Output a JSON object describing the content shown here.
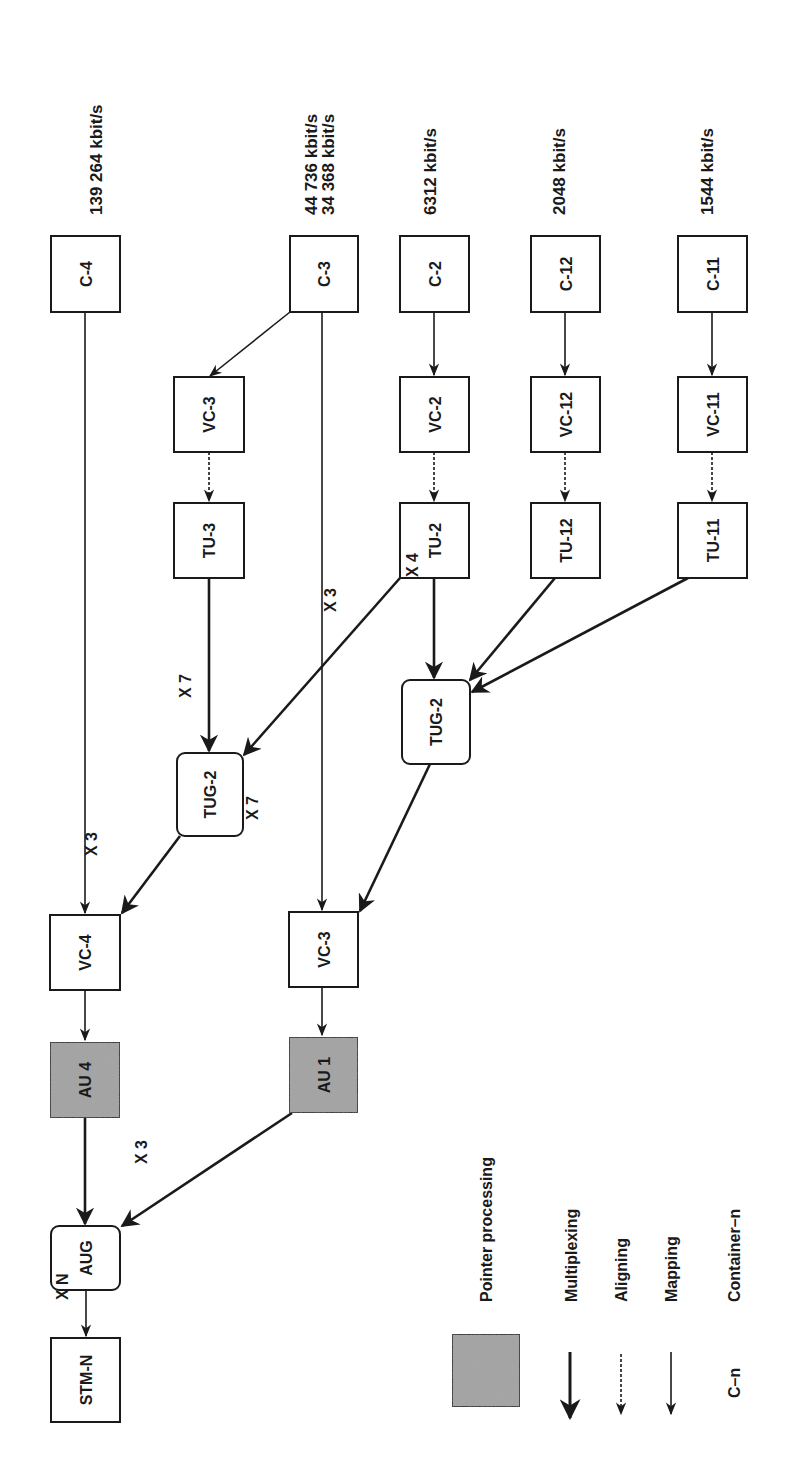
{
  "diagram": {
    "orientation": "rotated 90° counter-clockwise (text reads bottom-to-top)",
    "colors": {
      "stroke": "#1a1a1a",
      "box_fill": "#ffffff",
      "pointer_fill": "#a6a6a6",
      "background": "#ffffff"
    },
    "rates": [
      {
        "id": "rate-c4",
        "text": "139 264 kbit/s"
      },
      {
        "id": "rate-c3a",
        "text": "44 736 kbit/s"
      },
      {
        "id": "rate-c3b",
        "text": "34 368 kbit/s"
      },
      {
        "id": "rate-c2",
        "text": "6312 kbit/s"
      },
      {
        "id": "rate-c12",
        "text": "2048 kbit/s"
      },
      {
        "id": "rate-c11",
        "text": "1544 kbit/s"
      }
    ],
    "nodes": [
      {
        "id": "c4",
        "label": "C-4",
        "kind": "container"
      },
      {
        "id": "c3",
        "label": "C-3",
        "kind": "container"
      },
      {
        "id": "c2",
        "label": "C-2",
        "kind": "container"
      },
      {
        "id": "c12",
        "label": "C-12",
        "kind": "container"
      },
      {
        "id": "c11",
        "label": "C-11",
        "kind": "container"
      },
      {
        "id": "vc3a",
        "label": "VC-3",
        "kind": "box"
      },
      {
        "id": "vc2",
        "label": "VC-2",
        "kind": "box"
      },
      {
        "id": "vc12",
        "label": "VC-12",
        "kind": "box"
      },
      {
        "id": "vc11",
        "label": "VC-11",
        "kind": "box"
      },
      {
        "id": "tu3",
        "label": "TU-3",
        "kind": "box"
      },
      {
        "id": "tu2",
        "label": "TU-2",
        "kind": "box"
      },
      {
        "id": "tu12",
        "label": "TU-12",
        "kind": "box"
      },
      {
        "id": "tu11",
        "label": "TU-11",
        "kind": "box"
      },
      {
        "id": "tug2b",
        "label": "TUG-2",
        "kind": "group"
      },
      {
        "id": "tug2a",
        "label": "TUG-2",
        "kind": "group"
      },
      {
        "id": "vc4",
        "label": "VC-4",
        "kind": "box"
      },
      {
        "id": "vc3b",
        "label": "VC-3",
        "kind": "box"
      },
      {
        "id": "au4",
        "label": "AU 4",
        "kind": "pointer"
      },
      {
        "id": "au1",
        "label": "AU 1",
        "kind": "pointer"
      },
      {
        "id": "aug",
        "label": "AUG",
        "kind": "group"
      },
      {
        "id": "stmn",
        "label": "STM-N",
        "kind": "box"
      }
    ],
    "edges": [
      {
        "from": "c4",
        "to": "vc4",
        "type": "mapping"
      },
      {
        "from": "c3",
        "to": "vc3a",
        "type": "mapping"
      },
      {
        "from": "c3",
        "to": "vc3b",
        "type": "mapping"
      },
      {
        "from": "c2",
        "to": "vc2",
        "type": "mapping"
      },
      {
        "from": "c12",
        "to": "vc12",
        "type": "mapping"
      },
      {
        "from": "c11",
        "to": "vc11",
        "type": "mapping"
      },
      {
        "from": "vc3a",
        "to": "tu3",
        "type": "aligning"
      },
      {
        "from": "vc2",
        "to": "tu2",
        "type": "aligning"
      },
      {
        "from": "vc12",
        "to": "tu12",
        "type": "aligning"
      },
      {
        "from": "vc11",
        "to": "tu11",
        "type": "aligning"
      },
      {
        "from": "tu3",
        "to": "tug2a",
        "type": "multiplexing"
      },
      {
        "from": "tu2",
        "to": "tug2a",
        "type": "multiplexing",
        "label": "X 7"
      },
      {
        "from": "tu2",
        "to": "tug2b",
        "type": "multiplexing"
      },
      {
        "from": "tu12",
        "to": "tug2b",
        "type": "multiplexing",
        "label": "X 3"
      },
      {
        "from": "tu11",
        "to": "tug2b",
        "type": "multiplexing",
        "label": "X 4"
      },
      {
        "from": "tug2a",
        "to": "vc4",
        "type": "multiplexing",
        "label": "X 3"
      },
      {
        "from": "tug2b",
        "to": "vc3b",
        "type": "multiplexing",
        "label": "X 7"
      },
      {
        "from": "vc4",
        "to": "au4",
        "type": "mapping"
      },
      {
        "from": "vc3b",
        "to": "au1",
        "type": "mapping"
      },
      {
        "from": "au4",
        "to": "aug",
        "type": "multiplexing"
      },
      {
        "from": "au1",
        "to": "aug",
        "type": "multiplexing",
        "label": "X 3"
      },
      {
        "from": "aug",
        "to": "stmn",
        "type": "mapping",
        "label": "X N"
      }
    ],
    "legend": {
      "pointer_processing": "Pointer processing",
      "multiplexing": "Multiplexing",
      "aligning": "Aligning",
      "mapping": "Mapping",
      "container_symbol": "C–n",
      "container_text": "Container–n"
    }
  }
}
